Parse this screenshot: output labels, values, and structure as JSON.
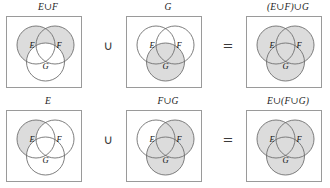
{
  "figure": {
    "caption_symbols": {
      "union": "∪",
      "equals": "="
    },
    "colors": {
      "shaded_fill": "#dcdcdc",
      "unshaded_fill": "#ffffff",
      "circle_stroke": "#6f6f6f",
      "box_stroke": "#9a9a9a",
      "text": "#1c1c1c"
    },
    "set_labels": {
      "e": "E",
      "f": "F",
      "g": "G"
    },
    "rows": [
      {
        "id": "row-associative-left-grouping",
        "operator_1": "∪",
        "operator_2": "=",
        "panels": [
          {
            "id": "panel-e-union-f",
            "label": "E∪F",
            "shaded": {
              "e": true,
              "f": true,
              "g": false
            }
          },
          {
            "id": "panel-g",
            "label": "G",
            "shaded": {
              "e": false,
              "f": false,
              "g": true
            }
          },
          {
            "id": "panel-e-union-f-paren-union-g",
            "label": "(E∪F)∪G",
            "shaded": {
              "e": true,
              "f": true,
              "g": true
            }
          }
        ]
      },
      {
        "id": "row-associative-right-grouping",
        "operator_1": "∪",
        "operator_2": "=",
        "panels": [
          {
            "id": "panel-e",
            "label": "E",
            "shaded": {
              "e": true,
              "f": false,
              "g": false
            }
          },
          {
            "id": "panel-f-union-g",
            "label": "F∪G",
            "shaded": {
              "e": false,
              "f": true,
              "g": true
            }
          },
          {
            "id": "panel-e-union-paren-f-union-g",
            "label": "E∪(F∪G)",
            "shaded": {
              "e": true,
              "f": true,
              "g": true
            }
          }
        ]
      }
    ]
  }
}
